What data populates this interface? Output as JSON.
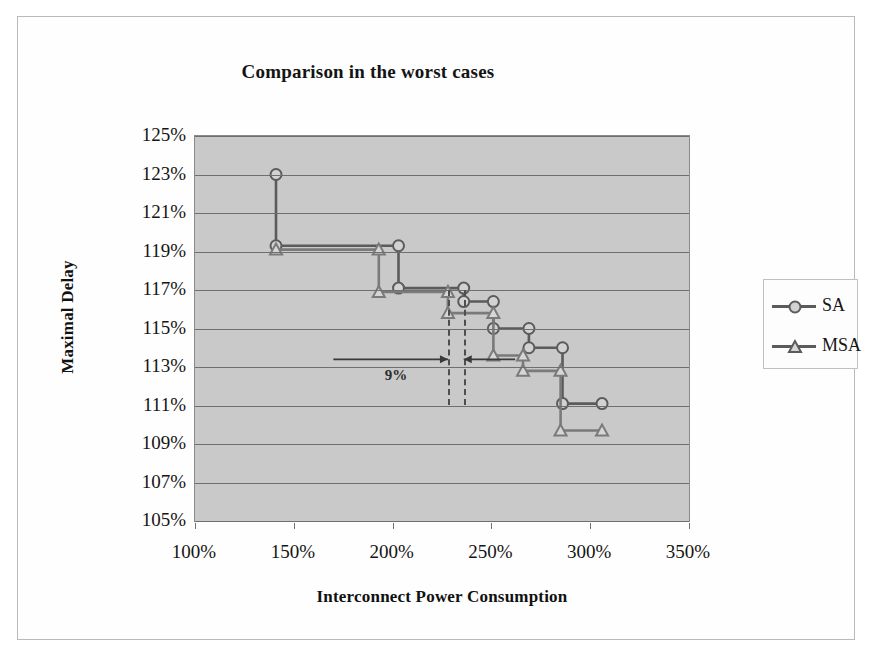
{
  "chart_data": {
    "type": "line",
    "title": "Comparison in the worst cases",
    "xlabel": "Interconnect Power Consumption",
    "ylabel": "Maximal Delay",
    "xlim": [
      100,
      350
    ],
    "ylim": [
      105,
      125
    ],
    "xticks": [
      "100%",
      "150%",
      "200%",
      "250%",
      "300%",
      "350%"
    ],
    "xtick_values": [
      100,
      150,
      200,
      250,
      300,
      350
    ],
    "yticks": [
      "105%",
      "107%",
      "109%",
      "111%",
      "113%",
      "115%",
      "117%",
      "119%",
      "121%",
      "123%",
      "125%"
    ],
    "ytick_values": [
      105,
      107,
      109,
      111,
      113,
      115,
      117,
      119,
      121,
      123,
      125
    ],
    "grid": "horizontal",
    "legend_position": "right",
    "drawstyle": "steps-post",
    "series": [
      {
        "name": "SA",
        "marker": "circle",
        "color": "#5b5b5b",
        "points": [
          [
            141,
            123.0
          ],
          [
            141,
            119.3
          ],
          [
            203,
            119.3
          ],
          [
            203,
            117.1
          ],
          [
            236,
            117.1
          ],
          [
            236,
            116.4
          ],
          [
            251,
            116.4
          ],
          [
            251,
            115.0
          ],
          [
            269,
            115.0
          ],
          [
            269,
            114.0
          ],
          [
            286,
            114.0
          ],
          [
            286,
            111.1
          ],
          [
            306,
            111.1
          ]
        ]
      },
      {
        "name": "MSA",
        "marker": "triangle",
        "color": "#7a7a7a",
        "points": [
          [
            141,
            119.1
          ],
          [
            193,
            119.1
          ],
          [
            193,
            116.9
          ],
          [
            228,
            116.9
          ],
          [
            228,
            115.8
          ],
          [
            251,
            115.8
          ],
          [
            251,
            113.6
          ],
          [
            266,
            113.6
          ],
          [
            266,
            112.8
          ],
          [
            285,
            112.8
          ],
          [
            285,
            109.7
          ],
          [
            306,
            109.7
          ]
        ]
      }
    ],
    "annotations": [
      {
        "label": "9%",
        "type": "double-arrow-span",
        "x_start": 228,
        "x_end": 236,
        "y": 113.4,
        "dashed_lines_at_x": [
          228,
          236
        ]
      }
    ]
  },
  "legend": {
    "items": [
      {
        "label": "SA",
        "marker": "circle-marker-icon"
      },
      {
        "label": "MSA",
        "marker": "triangle-marker-icon"
      }
    ]
  }
}
